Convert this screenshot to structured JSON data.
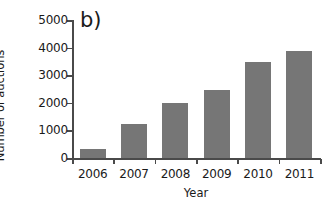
{
  "chart_data": {
    "type": "bar",
    "title": "b)",
    "xlabel": "Year",
    "ylabel": "Number of auctions",
    "categories": [
      "2006",
      "2007",
      "2008",
      "2009",
      "2010",
      "2011"
    ],
    "values": [
      330,
      1230,
      2000,
      2460,
      3480,
      3880
    ],
    "ylim": [
      0,
      5000
    ],
    "yticks": [
      0,
      1000,
      2000,
      3000,
      4000,
      5000
    ],
    "ytick_labels": [
      "0",
      "1000",
      "2000",
      "3000",
      "4000",
      "5000"
    ],
    "grid": false,
    "legend": false,
    "bar_color": "#767676",
    "axis_color": "#4a4a4a",
    "background_color": "#ffffff",
    "series": [
      {
        "name": "Number of auctions",
        "values": [
          330,
          1230,
          2000,
          2460,
          3480,
          3880
        ]
      }
    ]
  },
  "panel": {
    "label": "b)"
  },
  "axes": {
    "x_title": "Year",
    "y_title": "Number of auctions"
  }
}
